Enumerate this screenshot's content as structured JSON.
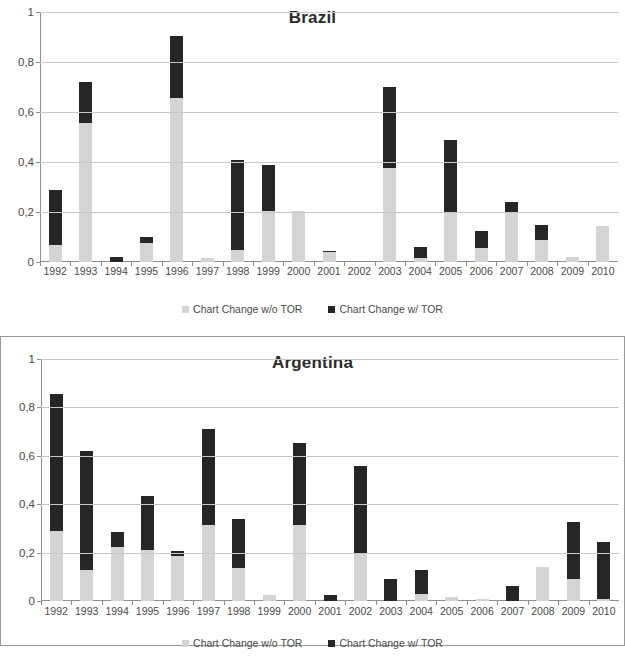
{
  "legend": {
    "series_light_label": "Chart Change w/o TOR",
    "series_dark_label": "Chart  Change w/ TOR",
    "swatch_light_color": "#d4d4d4",
    "swatch_dark_color": "#262626"
  },
  "charts": [
    {
      "title": "Brazil",
      "ytick_labels": [
        "1",
        "0,8",
        "0,6",
        "0,4",
        "0,2",
        "0"
      ]
    },
    {
      "title": "Argentina",
      "ytick_labels": [
        "1",
        "0,8",
        "0,6",
        "0,4",
        "0,2",
        "0"
      ]
    }
  ],
  "chart_data": [
    {
      "type": "bar",
      "stacked": true,
      "title": "Brazil",
      "xlabel": "",
      "ylabel": "",
      "ylim": [
        0,
        1
      ],
      "yticks": [
        0,
        0.2,
        0.4,
        0.6,
        0.8,
        1
      ],
      "ytick_labels": [
        "0",
        "0,2",
        "0,4",
        "0,6",
        "0,8",
        "1"
      ],
      "grid": true,
      "legend_position": "bottom",
      "categories": [
        "1992",
        "1993",
        "1994",
        "1995",
        "1996",
        "1997",
        "1998",
        "1999",
        "2000",
        "2001",
        "2002",
        "2003",
        "2004",
        "2005",
        "2006",
        "2007",
        "2008",
        "2009",
        "2010"
      ],
      "series": [
        {
          "name": "Chart Change w/o TOR",
          "color": "#d4d4d4",
          "values": [
            0.07,
            0.555,
            0.0,
            0.075,
            0.655,
            0.015,
            0.05,
            0.205,
            0.205,
            0.04,
            0.0,
            0.375,
            0.015,
            0.2,
            0.055,
            0.195,
            0.09,
            0.02,
            0.145
          ]
        },
        {
          "name": "Chart Change w/ TOR",
          "color": "#262626",
          "values": [
            0.29,
            0.72,
            0.02,
            0.1,
            0.905,
            0.0,
            0.41,
            0.39,
            0.0,
            0.045,
            0.0,
            0.7,
            0.06,
            0.49,
            0.125,
            0.24,
            0.15,
            0.0,
            0.0
          ]
        }
      ]
    },
    {
      "type": "bar",
      "stacked": true,
      "title": "Argentina",
      "xlabel": "",
      "ylabel": "",
      "ylim": [
        0,
        1
      ],
      "yticks": [
        0,
        0.2,
        0.4,
        0.6,
        0.8,
        1
      ],
      "ytick_labels": [
        "0",
        "0,2",
        "0,4",
        "0,6",
        "0,8",
        "1"
      ],
      "grid": true,
      "legend_position": "bottom",
      "categories": [
        "1992",
        "1993",
        "1994",
        "1995",
        "1996",
        "1997",
        "1998",
        "1999",
        "2000",
        "2001",
        "2002",
        "2003",
        "2004",
        "2005",
        "2006",
        "2007",
        "2008",
        "2009",
        "2010"
      ],
      "series": [
        {
          "name": "Chart Change w/o TOR",
          "color": "#d4d4d4",
          "values": [
            0.29,
            0.13,
            0.225,
            0.21,
            0.185,
            0.315,
            0.135,
            0.025,
            0.315,
            0.0,
            0.2,
            0.0,
            0.03,
            0.015,
            0.008,
            0.0,
            0.14,
            0.09,
            0.01
          ]
        },
        {
          "name": "Chart Change w/ TOR",
          "color": "#262626",
          "values": [
            0.855,
            0.62,
            0.285,
            0.435,
            0.205,
            0.71,
            0.34,
            0.0,
            0.655,
            0.025,
            0.56,
            0.09,
            0.13,
            0.0,
            0.0,
            0.06,
            0.0,
            0.325,
            0.245
          ]
        }
      ]
    }
  ]
}
